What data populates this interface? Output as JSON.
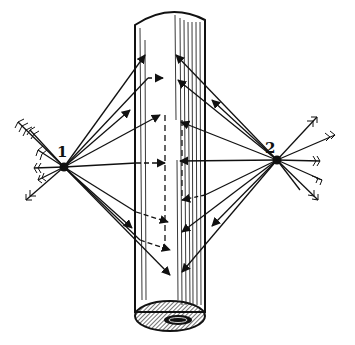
{
  "figure": {
    "labels": [
      {
        "id": "point-1",
        "text": "1",
        "x": 62,
        "y": 157
      },
      {
        "id": "point-2",
        "text": "2",
        "x": 270,
        "y": 153
      }
    ],
    "colors": {
      "ink": "#111111",
      "paper": "#ffffff"
    },
    "cylinder": {
      "left": 135,
      "right": 205,
      "top": 12,
      "bottom": 318
    },
    "origins": {
      "p1": {
        "x": 64,
        "y": 167
      },
      "p2": {
        "x": 277,
        "y": 160
      }
    },
    "targets_from_p1": [
      {
        "x": 165,
        "y": 55
      },
      {
        "x": 165,
        "y": 78
      },
      {
        "x": 165,
        "y": 115
      },
      {
        "x": 167,
        "y": 163
      },
      {
        "x": 170,
        "y": 216
      },
      {
        "x": 170,
        "y": 250
      },
      {
        "x": 172,
        "y": 275
      }
    ],
    "targets_from_p2": [
      {
        "x": 175,
        "y": 55
      },
      {
        "x": 178,
        "y": 80
      },
      {
        "x": 180,
        "y": 120
      },
      {
        "x": 180,
        "y": 163
      },
      {
        "x": 182,
        "y": 200
      },
      {
        "x": 180,
        "y": 230
      },
      {
        "x": 180,
        "y": 272
      }
    ]
  }
}
